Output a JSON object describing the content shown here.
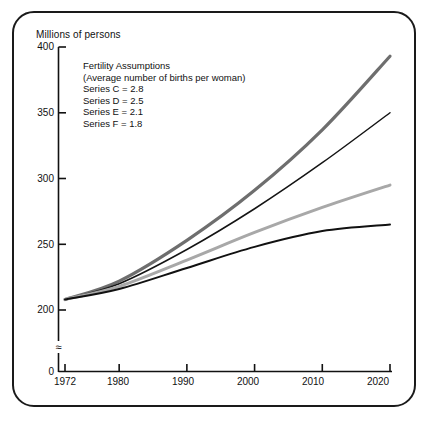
{
  "figure": {
    "axis_title": "Millions of persons",
    "legend": {
      "title": "Fertility Assumptions",
      "subtitle": "(Average number of births per woman)",
      "entries": [
        "Series C = 2.8",
        "Series D = 2.5",
        "Series E = 2.1",
        "Series F = 1.8"
      ]
    }
  },
  "chart_data": {
    "type": "line",
    "title": "",
    "subtitle": "",
    "xlabel": "",
    "ylabel": "Millions of persons",
    "xlim": [
      1972,
      2020
    ],
    "ylim": [
      200,
      400
    ],
    "y_axis_break": true,
    "y_break_symbol": "≈",
    "grid": false,
    "legend_position": "upper-left-inside",
    "annotations": [
      "Fertility Assumptions",
      "(Average number of births per woman)"
    ],
    "xticks": [
      "1972",
      "1980",
      "1990",
      "2000",
      "2010",
      "2020"
    ],
    "xtick_values": [
      1972,
      1980,
      1990,
      2000,
      2010,
      2020
    ],
    "yticks": [
      "0",
      "200",
      "250",
      "300",
      "350",
      "400"
    ],
    "ytick_values": [
      0,
      200,
      250,
      300,
      350,
      400
    ],
    "x": [
      1972,
      1980,
      1990,
      2000,
      2010,
      2020
    ],
    "series": [
      {
        "name": "Series C = 2.8",
        "fertility": 2.8,
        "color": "#6e6e6e",
        "width": 3.2,
        "values": [
          208,
          222,
          253,
          291,
          337,
          393
        ]
      },
      {
        "name": "Series D = 2.5",
        "fertility": 2.5,
        "color": "#141414",
        "width": 1.5,
        "values": [
          208,
          220,
          246,
          277,
          312,
          350
        ]
      },
      {
        "name": "Series E = 2.1",
        "fertility": 2.1,
        "color": "#a8a8a8",
        "width": 3.0,
        "values": [
          208,
          218,
          238,
          259,
          278,
          295
        ]
      },
      {
        "name": "Series F = 1.8",
        "fertility": 1.8,
        "color": "#111111",
        "width": 2.0,
        "values": [
          208,
          216,
          232,
          248,
          260,
          265
        ]
      }
    ]
  }
}
